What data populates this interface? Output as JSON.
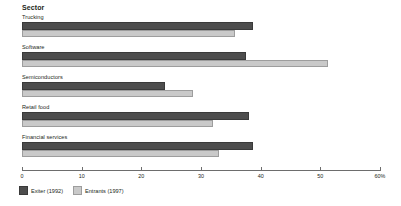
{
  "chart_data": {
    "type": "bar",
    "orientation": "horizontal",
    "title": "",
    "axis_group_title": "Sector",
    "categories": [
      "Trucking",
      "Software",
      "Semiconductors",
      "Retail food",
      "Financial services"
    ],
    "series": [
      {
        "name": "Exiter (1992)",
        "color": "#4d4d4d",
        "values": [
          38.7,
          37.5,
          24.0,
          38.0,
          38.7
        ]
      },
      {
        "name": "Entrants (1997)",
        "color": "#c9c9c9",
        "values": [
          35.7,
          51.3,
          28.6,
          32.0,
          33.0
        ]
      }
    ],
    "xlabel": "",
    "ylabel": "Sector",
    "xlim": [
      0,
      60
    ],
    "xticks": [
      0,
      10,
      20,
      30,
      40,
      50,
      60
    ],
    "xtick_labels": [
      "0",
      "10",
      "20",
      "30",
      "40",
      "50",
      "60%"
    ],
    "grid": false,
    "legend_position": "bottom-left"
  },
  "legend": {
    "items": [
      {
        "label": "Exiter (1992)",
        "swatch": "dark-gray-swatch"
      },
      {
        "label": "Entrants (1997)",
        "swatch": "light-gray-swatch"
      }
    ]
  }
}
